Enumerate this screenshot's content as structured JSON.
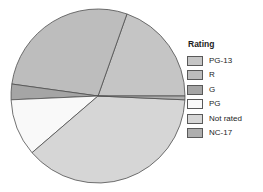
{
  "figure": {
    "background": "#ffffff",
    "outline_color": "#4f4f4f"
  },
  "legend": {
    "title": "Rating",
    "position": "right"
  },
  "chart_data": {
    "type": "pie",
    "legend_title": "Rating",
    "categories": [
      "PG-13",
      "R",
      "G",
      "PG",
      "Not rated",
      "NC-17"
    ],
    "values_percent": [
      19.6,
      28.2,
      2.9,
      10.6,
      38.0,
      0.7
    ],
    "colors": [
      "#c5c5c5",
      "#bdbdbd",
      "#a5a5a5",
      "#f9f9f9",
      "#d6d6d6",
      "#aeaeae"
    ],
    "start_angle_deg": 0,
    "direction": "counterclockwise",
    "geometry": {
      "cx": 98,
      "cy": 96,
      "r": 87
    },
    "slice_edge_color": "#4f4f4f",
    "labels_on_slices": false,
    "legend_position": "right"
  }
}
